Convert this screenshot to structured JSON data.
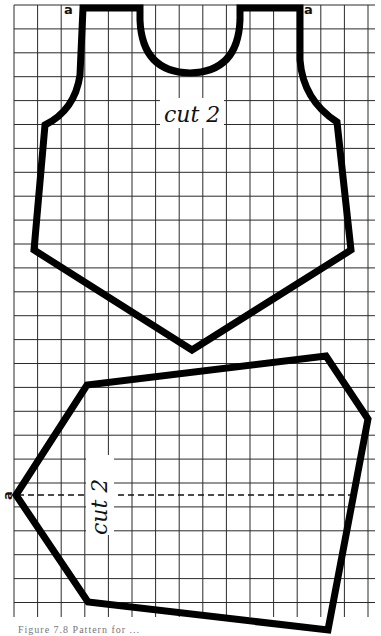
{
  "figure": {
    "background": "#ffffff",
    "grid_color": "#2a2a2a",
    "outline_color": "#000000",
    "pieces": [
      {
        "id": "bodice",
        "label": "cut 2",
        "corner_markers": [
          "a",
          "a"
        ]
      },
      {
        "id": "lower-panel",
        "label": "cut 2",
        "corner_markers": [
          "a"
        ],
        "fold_line": "dashed"
      }
    ],
    "caption": "Figure 7.8  Pattern for ..."
  },
  "labels": {
    "top_cut": "cut 2",
    "bottom_cut": "cut 2",
    "marker_a_left": "a",
    "marker_a_right": "a",
    "marker_a_bottom": "a"
  }
}
